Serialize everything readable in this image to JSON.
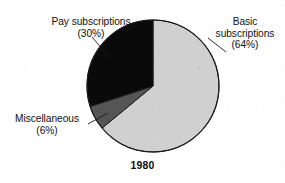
{
  "chart_data": {
    "type": "pie",
    "title": "",
    "caption": "1980",
    "xlabel": "",
    "ylabel": "",
    "legend_position": "none",
    "grid": false,
    "categories": [
      "Basic subscriptions",
      "Pay subscriptions",
      "Miscellaneous"
    ],
    "values": [
      64,
      30,
      6
    ],
    "unit": "%",
    "slices": [
      {
        "label": "Basic subscriptions",
        "label_line1": "Basic",
        "label_line2": "subscriptions",
        "percent_text": "(64%)",
        "value": 64,
        "color": "#d0d0d0",
        "start_angle_deg": 0,
        "end_angle_deg": 230.4
      },
      {
        "label": "Pay subscriptions",
        "label_line1": "Pay subscriptions",
        "label_line2": "",
        "percent_text": "(30%)",
        "value": 30,
        "color": "#0a0a0a",
        "start_angle_deg": 252.0,
        "end_angle_deg": 360.0
      },
      {
        "label": "Miscellaneous",
        "label_line1": "Miscellaneous",
        "label_line2": "",
        "percent_text": "(6%)",
        "value": 6,
        "color": "#555555",
        "start_angle_deg": 230.4,
        "end_angle_deg": 252.0
      }
    ],
    "colors": {
      "basic": "#d0d0d0",
      "pay": "#0a0a0a",
      "miscellaneous": "#555555",
      "outline": "#1a1a1a",
      "background": "#ffffff",
      "text": "#111111"
    }
  },
  "chart": {
    "caption": "1980",
    "labels": {
      "pay": {
        "name": "Pay subscriptions",
        "percent": "(30%)"
      },
      "basic": {
        "name_line1": "Basic",
        "name_line2": "subscriptions",
        "percent": "(64%)"
      },
      "miscellaneous": {
        "name": "Miscellaneous",
        "percent": "(6%)"
      }
    }
  }
}
